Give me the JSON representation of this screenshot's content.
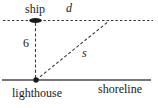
{
  "diagram": {
    "labels": {
      "ship": "ship",
      "horizontal_distance": "d",
      "vertical_distance": "6",
      "sight_distance": "s",
      "lighthouse": "lighthouse",
      "shoreline": "shoreline"
    },
    "colors": {
      "dashed_line": "#3a3a3a",
      "shoreline_line": "#777777",
      "marker": "#1a1a1a",
      "text": "#1a1a1a",
      "background": "#ffffff"
    }
  }
}
